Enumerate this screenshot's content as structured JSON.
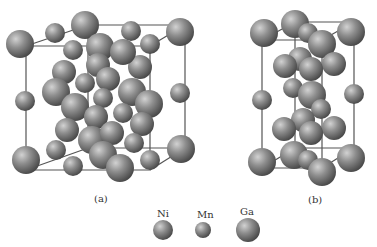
{
  "figure": {
    "panel_a_label": "(a)",
    "panel_b_label": "(b)"
  },
  "legend": {
    "items": [
      {
        "label": "Ni",
        "radius": 11
      },
      {
        "label": "Mn",
        "radius": 9
      },
      {
        "label": "Ga",
        "radius": 13
      }
    ]
  },
  "colors": {
    "atom_fill": "#8a8a8a",
    "atom_highlight": "#c8c8c8",
    "atom_shadow": "#4a4a4a",
    "bond": "#555555",
    "background": "#ffffff"
  }
}
